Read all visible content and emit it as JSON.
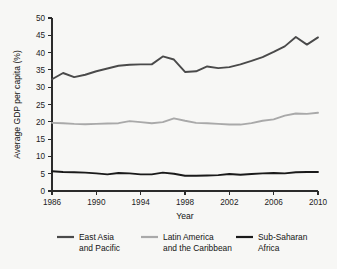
{
  "chart_data": {
    "type": "line",
    "title": "",
    "xlabel": "Year",
    "ylabel": "Average GDP per capita (%)",
    "xlim": [
      1986,
      2010
    ],
    "ylim": [
      0,
      50
    ],
    "xticks": [
      1986,
      1990,
      1994,
      1998,
      2002,
      2006,
      2010
    ],
    "yticks": [
      0,
      5,
      10,
      15,
      20,
      25,
      30,
      35,
      40,
      45,
      50
    ],
    "grid": false,
    "legend_position": "bottom",
    "x": [
      1986,
      1987,
      1988,
      1989,
      1990,
      1991,
      1992,
      1993,
      1994,
      1995,
      1996,
      1997,
      1998,
      1999,
      2000,
      2001,
      2002,
      2003,
      2004,
      2005,
      2006,
      2007,
      2008,
      2009,
      2010
    ],
    "series": [
      {
        "name": "East Asia and Pacific",
        "color": "#4a4a4a",
        "values": [
          32.3,
          34.1,
          32.9,
          33.6,
          34.6,
          35.4,
          36.2,
          36.5,
          36.6,
          36.6,
          38.9,
          38.0,
          34.4,
          34.6,
          36.0,
          35.5,
          35.8,
          36.6,
          37.6,
          38.7,
          40.2,
          41.8,
          44.5,
          42.3,
          44.4
        ]
      },
      {
        "name": "Latin America and the Caribbean",
        "color": "#a9a9a9",
        "values": [
          19.7,
          19.6,
          19.4,
          19.3,
          19.4,
          19.5,
          19.6,
          20.2,
          19.9,
          19.6,
          19.9,
          21.0,
          20.3,
          19.7,
          19.6,
          19.4,
          19.2,
          19.2,
          19.6,
          20.3,
          20.7,
          21.8,
          22.4,
          22.3,
          22.6
        ]
      },
      {
        "name": "Sub-Saharan Africa",
        "color": "#1a1a1a",
        "values": [
          5.7,
          5.5,
          5.4,
          5.3,
          5.1,
          4.8,
          5.2,
          5.1,
          4.8,
          4.8,
          5.3,
          5.0,
          4.4,
          4.4,
          4.5,
          4.6,
          4.9,
          4.7,
          4.9,
          5.1,
          5.2,
          5.1,
          5.4,
          5.5,
          5.5
        ]
      }
    ],
    "legend": [
      {
        "line1": "East Asia",
        "line2": "and Pacific",
        "color": "#4a4a4a"
      },
      {
        "line1": "Latin America",
        "line2": "and the Caribbean",
        "color": "#a9a9a9"
      },
      {
        "line1": "Sub-Saharan",
        "line2": "Africa",
        "color": "#1a1a1a"
      }
    ]
  },
  "figure": {
    "background": "#f7f7f5",
    "axis_color": "#2b2b2b"
  }
}
